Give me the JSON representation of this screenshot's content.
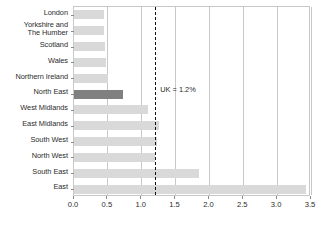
{
  "chart_data": {
    "type": "bar",
    "orientation": "horizontal",
    "title": "",
    "subtitle": "",
    "xlabel": "",
    "ylabel": "",
    "xlim": [
      0.0,
      3.5
    ],
    "xticks": [
      "0.0",
      "0.5",
      "1.0",
      "1.5",
      "2.0",
      "2.5",
      "3.0",
      "3.5"
    ],
    "xtick_values": [
      0.0,
      0.5,
      1.0,
      1.5,
      2.0,
      2.5,
      3.0,
      3.5
    ],
    "grid": "vertical",
    "legend": "none",
    "categories": [
      "London",
      "Yorkshire and\nThe Humber",
      "Scotland",
      "Wales",
      "Northern Ireland",
      "North East",
      "West Midlands",
      "East Midlands",
      "South West",
      "North West",
      "South East",
      "East"
    ],
    "values": [
      0.44,
      0.44,
      0.46,
      0.47,
      0.5,
      0.72,
      1.1,
      1.25,
      1.23,
      1.2,
      1.85,
      3.42
    ],
    "highlight_category": "North East",
    "bar_color": "#d9d9d9",
    "highlight_color": "#808080",
    "annotations": [
      {
        "name": "uk-reference-line",
        "label": "UK = 1.2%",
        "value": 1.2,
        "style": "dashed",
        "color": "#111111"
      }
    ]
  }
}
